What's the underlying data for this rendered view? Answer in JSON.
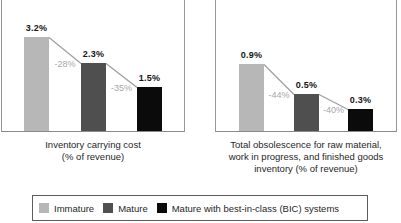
{
  "figure": {
    "background": "#ffffff",
    "text_color": "#1f1f1f",
    "box_border_color": "#979797",
    "connector_color": "#9e9e9e",
    "delta_text_color": "#a8a8a8"
  },
  "legend": {
    "items": [
      {
        "label": "Immature",
        "color": "#b7b7b7"
      },
      {
        "label": "Mature",
        "color": "#4f4f4f"
      },
      {
        "label": "Mature with best-in-class (BIC) systems",
        "color": "#0b0b0b"
      }
    ]
  },
  "chart_data": [
    {
      "type": "bar",
      "title": "Inventory carrying cost (% of revenue)",
      "caption_lines": [
        "Inventory carrying cost",
        "(% of revenue)"
      ],
      "categories": [
        "Immature",
        "Mature",
        "Mature with best-in-class (BIC) systems"
      ],
      "values": [
        3.2,
        2.3,
        1.5
      ],
      "value_labels": [
        "3.2%",
        "2.3%",
        "1.5%"
      ],
      "delta_labels": [
        "-28%",
        "-35%"
      ],
      "bar_colors": [
        "#b7b7b7",
        "#4f4f4f",
        "#0b0b0b"
      ],
      "ylabel": "% of revenue",
      "grid": false,
      "max_bar_px": 94
    },
    {
      "type": "bar",
      "title": "Total obsolescence for raw material, work in progress, and finished goods inventory (% of revenue)",
      "caption_lines": [
        "Total obsolescence for raw material,",
        "work in progress, and finished goods",
        "inventory (% of revenue)"
      ],
      "categories": [
        "Immature",
        "Mature",
        "Mature with best-in-class (BIC) systems"
      ],
      "values": [
        0.9,
        0.5,
        0.3
      ],
      "value_labels": [
        "0.9%",
        "0.5%",
        "0.3%"
      ],
      "delta_labels": [
        "-44%",
        "-40%"
      ],
      "bar_colors": [
        "#b7b7b7",
        "#4f4f4f",
        "#0b0b0b"
      ],
      "ylabel": "% of revenue",
      "grid": false,
      "max_bar_px": 67
    }
  ]
}
